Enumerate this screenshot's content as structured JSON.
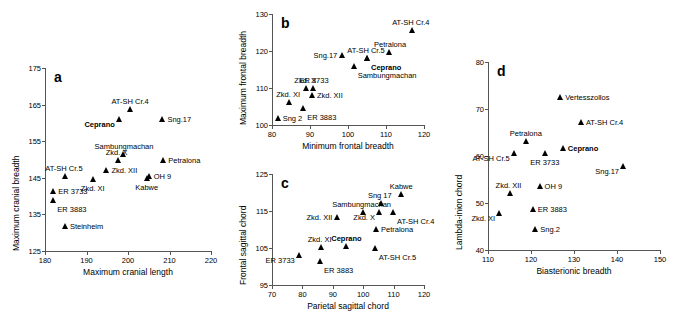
{
  "figure": {
    "title": "",
    "panel_count": 4
  },
  "chart_data": [
    {
      "type": "scatter",
      "panel": "a",
      "title": "",
      "xlabel": "Maximum cranial length",
      "ylabel": "Maximum cranial breadth",
      "xlim": [
        180,
        220
      ],
      "ylim": [
        125,
        175
      ],
      "xticks": [
        180,
        190,
        200,
        210,
        220
      ],
      "yticks": [
        125,
        135,
        145,
        155,
        165,
        175
      ],
      "grid": false,
      "legend": "none",
      "points": [
        {
          "label": "AT-SH Cr.4",
          "x": 200.5,
          "y": 163.8,
          "pos": "above",
          "bold": false
        },
        {
          "label": "Sng.17",
          "x": 208.3,
          "y": 161.0,
          "pos": "east",
          "bold": false
        },
        {
          "label": "Ceprano",
          "x": 197.8,
          "y": 161.0,
          "pos": "below-west",
          "bold": true
        },
        {
          "label": "Sambungmachan",
          "x": 198.8,
          "y": 151.5,
          "pos": "above-east",
          "bold": false
        },
        {
          "label": "Zkd. X",
          "x": 197.5,
          "y": 150.0,
          "pos": "above-west",
          "bold": false
        },
        {
          "label": "Petralona",
          "x": 208.5,
          "y": 150.0,
          "pos": "east",
          "bold": false
        },
        {
          "label": "Zkd. XII",
          "x": 194.8,
          "y": 147.0,
          "pos": "east",
          "bold": false
        },
        {
          "label": "OH 9",
          "x": 205.0,
          "y": 145.5,
          "pos": "east",
          "bold": false
        },
        {
          "label": "Kabwe",
          "x": 204.5,
          "y": 145.0,
          "pos": "below",
          "bold": false
        },
        {
          "label": "AT-SH Cr.5",
          "x": 184.8,
          "y": 145.5,
          "pos": "above-west",
          "bold": false
        },
        {
          "label": "Zkd. XI",
          "x": 191.5,
          "y": 144.8,
          "pos": "below",
          "bold": false
        },
        {
          "label": "ER 3733",
          "x": 182.0,
          "y": 141.5,
          "pos": "east",
          "bold": false
        },
        {
          "label": "ER 3883",
          "x": 182.0,
          "y": 138.8,
          "pos": "below-east",
          "bold": false
        },
        {
          "label": "Steinheim",
          "x": 184.8,
          "y": 131.8,
          "pos": "east",
          "bold": false
        }
      ]
    },
    {
      "type": "scatter",
      "panel": "b",
      "title": "",
      "xlabel": "Minimum frontal breadth",
      "ylabel": "Maximum frontal breadth",
      "xlim": [
        80,
        120
      ],
      "ylim": [
        100,
        130
      ],
      "xticks": [
        80,
        90,
        100,
        110,
        120
      ],
      "yticks": [
        100,
        110,
        120,
        130
      ],
      "grid": false,
      "legend": "none",
      "points": [
        {
          "label": "AT-SH Cr.4",
          "x": 116.8,
          "y": 125.8,
          "pos": "above-west",
          "bold": false
        },
        {
          "label": "Petralona",
          "x": 110.8,
          "y": 119.8,
          "pos": "above-east",
          "bold": false
        },
        {
          "label": "AT-SH Cr.5",
          "x": 105.0,
          "y": 118.2,
          "pos": "above-west",
          "bold": false
        },
        {
          "label": "Sng.17",
          "x": 98.5,
          "y": 119.0,
          "pos": "west",
          "bold": false
        },
        {
          "label": "Ceprano",
          "x": 105.0,
          "y": 118.2,
          "pos": "below-east",
          "bold": true
        },
        {
          "label": "Sambungmachan",
          "x": 101.5,
          "y": 116.0,
          "pos": "below-east",
          "bold": false
        },
        {
          "label": "ER 3733",
          "x": 90.8,
          "y": 110.0,
          "pos": "above-east",
          "bold": false
        },
        {
          "label": "Zkd. X",
          "x": 89.0,
          "y": 110.0,
          "pos": "above-west",
          "bold": false
        },
        {
          "label": "Zkd. XII",
          "x": 90.5,
          "y": 108.2,
          "pos": "east",
          "bold": false
        },
        {
          "label": "Zkd. XI",
          "x": 84.5,
          "y": 106.2,
          "pos": "above-west",
          "bold": false
        },
        {
          "label": "ER 3883",
          "x": 88.2,
          "y": 104.5,
          "pos": "below-east",
          "bold": false
        },
        {
          "label": "Sng 2",
          "x": 81.5,
          "y": 102.0,
          "pos": "east",
          "bold": false
        }
      ]
    },
    {
      "type": "scatter",
      "panel": "c",
      "title": "",
      "xlabel": "Parietal sagittal chord",
      "ylabel": "Frontal sagittal chord",
      "xlim": [
        70,
        120
      ],
      "ylim": [
        95,
        125
      ],
      "xticks": [
        70,
        80,
        90,
        100,
        110,
        120
      ],
      "yticks": [
        95,
        105,
        115,
        125
      ],
      "grid": false,
      "legend": "none",
      "points": [
        {
          "label": "Kabwe",
          "x": 112.5,
          "y": 119.5,
          "pos": "above",
          "bold": false
        },
        {
          "label": "Sng 17",
          "x": 105.8,
          "y": 117.2,
          "pos": "above-west",
          "bold": false
        },
        {
          "label": "Sambungmachan",
          "x": 99.8,
          "y": 114.8,
          "pos": "above-west",
          "bold": false
        },
        {
          "label": "Zkd. X",
          "x": 105.2,
          "y": 114.8,
          "pos": "below-west",
          "bold": false
        },
        {
          "label": "AT-SH Cr.4",
          "x": 109.8,
          "y": 114.8,
          "pos": "below-east",
          "bold": false
        },
        {
          "label": "Zkd. XII",
          "x": 91.5,
          "y": 113.5,
          "pos": "west",
          "bold": false
        },
        {
          "label": "Petralona",
          "x": 104.2,
          "y": 110.2,
          "pos": "east",
          "bold": false
        },
        {
          "label": "Zkd. XI",
          "x": 86.0,
          "y": 105.2,
          "pos": "above-west",
          "bold": false
        },
        {
          "label": "Ceprano",
          "x": 94.5,
          "y": 105.5,
          "pos": "above",
          "bold": true
        },
        {
          "label": "AT-SH Cr.5",
          "x": 103.8,
          "y": 105.0,
          "pos": "below-east",
          "bold": false
        },
        {
          "label": "ER 3733",
          "x": 78.8,
          "y": 103.0,
          "pos": "below-west",
          "bold": false
        },
        {
          "label": "ER 3883",
          "x": 85.8,
          "y": 101.5,
          "pos": "below-east",
          "bold": false
        }
      ]
    },
    {
      "type": "scatter",
      "panel": "d",
      "title": "",
      "xlabel": "Biasterionic breadth",
      "ylabel": "Lambda-inion chord",
      "xlim": [
        110,
        150
      ],
      "ylim": [
        40,
        80
      ],
      "xticks": [
        110,
        120,
        130,
        140,
        150
      ],
      "yticks": [
        40,
        50,
        60,
        70,
        80
      ],
      "grid": false,
      "legend": "none",
      "points": [
        {
          "label": "Vertesszollos",
          "x": 126.8,
          "y": 72.6,
          "pos": "east",
          "bold": false
        },
        {
          "label": "AT-SH Cr.4",
          "x": 131.6,
          "y": 67.2,
          "pos": "east",
          "bold": false
        },
        {
          "label": "Petralona",
          "x": 118.8,
          "y": 63.2,
          "pos": "above",
          "bold": false
        },
        {
          "label": "Ceprano",
          "x": 127.4,
          "y": 61.6,
          "pos": "east",
          "bold": true
        },
        {
          "label": "AT-SH Cr.5",
          "x": 116.0,
          "y": 60.7,
          "pos": "below-west",
          "bold": false
        },
        {
          "label": "ER 3733",
          "x": 123.2,
          "y": 60.6,
          "pos": "below",
          "bold": false
        },
        {
          "label": "Sng.17",
          "x": 141.4,
          "y": 57.8,
          "pos": "below-west",
          "bold": false
        },
        {
          "label": "OH 9",
          "x": 122.0,
          "y": 53.7,
          "pos": "east",
          "bold": false
        },
        {
          "label": "Zkd. XII",
          "x": 115.0,
          "y": 52.2,
          "pos": "above-west",
          "bold": false
        },
        {
          "label": "ER 3883",
          "x": 120.4,
          "y": 48.8,
          "pos": "east",
          "bold": false
        },
        {
          "label": "Zkd. XI",
          "x": 112.6,
          "y": 47.8,
          "pos": "below-west",
          "bold": false
        },
        {
          "label": "Sng.2",
          "x": 121.0,
          "y": 44.5,
          "pos": "east",
          "bold": false
        }
      ]
    }
  ],
  "panels": [
    {
      "letter": "a",
      "box": {
        "left": 45,
        "top": 68,
        "width": 166,
        "height": 183
      }
    },
    {
      "letter": "b",
      "box": {
        "left": 272,
        "top": 14,
        "width": 152,
        "height": 111
      }
    },
    {
      "letter": "c",
      "box": {
        "left": 272,
        "top": 174,
        "width": 152,
        "height": 111
      }
    },
    {
      "letter": "d",
      "box": {
        "left": 488,
        "top": 62,
        "width": 172,
        "height": 188
      }
    }
  ]
}
